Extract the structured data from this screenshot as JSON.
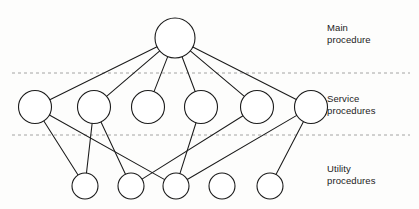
{
  "diagram": {
    "bands": [
      {
        "id": "main",
        "label": "Main\nprocedure"
      },
      {
        "id": "service",
        "label": "Service\nprocedures"
      },
      {
        "id": "utility",
        "label": "Utility\nprocedures"
      }
    ],
    "colors": {
      "node_stroke": "#1b1b1b",
      "node_fill": "#ffffff",
      "edge": "#1b1b1b",
      "divider": "#9a9a9a",
      "background": "#fdfdfc",
      "text": "#1b1b1b"
    },
    "dividers": [
      {
        "id": "divider-main-service",
        "y": 73,
        "x1": 12,
        "x2": 410
      },
      {
        "id": "divider-service-utility",
        "y": 135,
        "x1": 12,
        "x2": 410
      }
    ],
    "nodes": [
      {
        "id": "main-1",
        "band": "main",
        "cx": 175,
        "cy": 38,
        "r": 20
      },
      {
        "id": "service-1",
        "band": "service",
        "cx": 35,
        "cy": 107,
        "r": 16.5
      },
      {
        "id": "service-2",
        "band": "service",
        "cx": 94,
        "cy": 107,
        "r": 16.5
      },
      {
        "id": "service-3",
        "band": "service",
        "cx": 148,
        "cy": 107,
        "r": 16.5
      },
      {
        "id": "service-4",
        "band": "service",
        "cx": 201,
        "cy": 107,
        "r": 16.5
      },
      {
        "id": "service-5",
        "band": "service",
        "cx": 257,
        "cy": 107,
        "r": 16.5
      },
      {
        "id": "service-6",
        "band": "service",
        "cx": 311,
        "cy": 107,
        "r": 16.5
      },
      {
        "id": "utility-1",
        "band": "utility",
        "cx": 85,
        "cy": 186,
        "r": 13
      },
      {
        "id": "utility-2",
        "band": "utility",
        "cx": 131,
        "cy": 186,
        "r": 13
      },
      {
        "id": "utility-3",
        "band": "utility",
        "cx": 176,
        "cy": 186,
        "r": 13
      },
      {
        "id": "utility-4",
        "band": "utility",
        "cx": 222,
        "cy": 186,
        "r": 13
      },
      {
        "id": "utility-5",
        "band": "utility",
        "cx": 270,
        "cy": 186,
        "r": 13
      }
    ],
    "edges": [
      {
        "id": "edge-main-service-1",
        "from": "main-1",
        "to": "service-1"
      },
      {
        "id": "edge-main-service-2",
        "from": "main-1",
        "to": "service-2"
      },
      {
        "id": "edge-main-service-3",
        "from": "main-1",
        "to": "service-3"
      },
      {
        "id": "edge-main-service-4",
        "from": "main-1",
        "to": "service-4"
      },
      {
        "id": "edge-main-service-5",
        "from": "main-1",
        "to": "service-5"
      },
      {
        "id": "edge-main-service-6",
        "from": "main-1",
        "to": "service-6"
      },
      {
        "id": "edge-service-1-utility-1",
        "from": "service-1",
        "to": "utility-1"
      },
      {
        "id": "edge-service-1-utility-3",
        "from": "service-1",
        "to": "utility-3"
      },
      {
        "id": "edge-service-2-utility-1",
        "from": "service-2",
        "to": "utility-1"
      },
      {
        "id": "edge-service-2-utility-2",
        "from": "service-2",
        "to": "utility-2"
      },
      {
        "id": "edge-service-4-utility-3",
        "from": "service-4",
        "to": "utility-3"
      },
      {
        "id": "edge-service-5-utility-2",
        "from": "service-5",
        "to": "utility-2"
      },
      {
        "id": "edge-service-6-utility-3",
        "from": "service-6",
        "to": "utility-3"
      },
      {
        "id": "edge-service-6-utility-5",
        "from": "service-6",
        "to": "utility-5"
      }
    ]
  }
}
